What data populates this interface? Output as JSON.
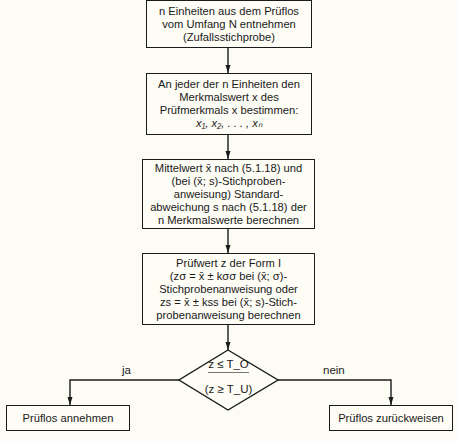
{
  "flowchart": {
    "steps": [
      {
        "id": "sample",
        "lines": [
          "n Einheiten aus dem Prüflos",
          "vom Umfang N entnehmen",
          "(Zufallsstichprobe)"
        ]
      },
      {
        "id": "measure",
        "lines": [
          "An jeder der n Einheiten den",
          "Merkmalswert x des",
          "Prüfmerkmals x bestimmen:",
          "x₁, x₂, . . . , xₙ"
        ]
      },
      {
        "id": "compute-stats",
        "lines": [
          "Mittelwert x̄ nach (5.1.18) und",
          "(bei (x̄; s)-Stichproben-",
          "anweisung) Standard-",
          "abweichung s nach (5.1.18) der",
          "n Merkmalswerte berechnen"
        ]
      },
      {
        "id": "test-value",
        "lines": [
          "Prüfwert z der Form I",
          "(zσ = x̄ ± kσσ bei (x̄; σ)-",
          "Stichprobenanweisung oder",
          "zs = x̄ ± kss bei (x̄; s)-Stich-",
          "probenanweisung berechnen"
        ]
      }
    ],
    "decision": {
      "condition": "z ≤ T_O",
      "condition_alt": "(z ≥ T_U)",
      "yes_label": "ja",
      "no_label": "nein"
    },
    "outcomes": {
      "accept": "Prüflos annehmen",
      "reject": "Prüflos zurückweisen"
    }
  }
}
